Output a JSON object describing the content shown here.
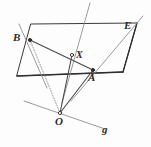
{
  "figure": {
    "kind": "geometry-diagram",
    "width": 151,
    "height": 147,
    "background": "#fdfdfd",
    "ink": "#3a3a3a",
    "ink_light": "#8f8f8f"
  },
  "labels": {
    "plane": "E",
    "point_b": "B",
    "point_x": "X",
    "point_a": "A",
    "point_o": "O",
    "line_g": "g"
  },
  "points": {
    "B": {
      "x": 30,
      "y": 40
    },
    "X": {
      "x": 72,
      "y": 55
    },
    "A": {
      "x": 93,
      "y": 70
    },
    "O": {
      "x": 60,
      "y": 113
    }
  },
  "plane_polygon": {
    "name": "plane-E",
    "vertices": [
      {
        "x": 31,
        "y": 24
      },
      {
        "x": 137,
        "y": 23
      },
      {
        "x": 123,
        "y": 72
      },
      {
        "x": 17,
        "y": 76
      }
    ]
  },
  "segments": [
    {
      "name": "segment-BA",
      "from": {
        "x": 30,
        "y": 40
      },
      "to": {
        "x": 93,
        "y": 70
      },
      "style": "solid"
    },
    {
      "name": "segment-BO",
      "from": {
        "x": 30,
        "y": 40
      },
      "to": {
        "x": 60,
        "y": 113
      },
      "style": "dotted"
    },
    {
      "name": "segment-AO",
      "from": {
        "x": 93,
        "y": 70
      },
      "to": {
        "x": 60,
        "y": 113
      },
      "style": "solid"
    },
    {
      "name": "segment-XO",
      "from": {
        "x": 72,
        "y": 55
      },
      "to": {
        "x": 60,
        "y": 113
      },
      "style": "solid"
    }
  ],
  "rays": [
    {
      "name": "ray-through-B",
      "from": {
        "x": 19,
        "y": 24
      },
      "to": {
        "x": 47,
        "y": 88
      },
      "style": "solid"
    },
    {
      "name": "ray-through-X",
      "from": {
        "x": 90,
        "y": 3
      },
      "to": {
        "x": 62,
        "y": 103
      },
      "style": "solid"
    },
    {
      "name": "ray-through-A",
      "from": {
        "x": 143,
        "y": 16
      },
      "to": {
        "x": 71,
        "y": 101
      },
      "style": "solid"
    },
    {
      "name": "line-g",
      "from": {
        "x": 24,
        "y": 101
      },
      "to": {
        "x": 105,
        "y": 129
      },
      "style": "solid"
    }
  ]
}
